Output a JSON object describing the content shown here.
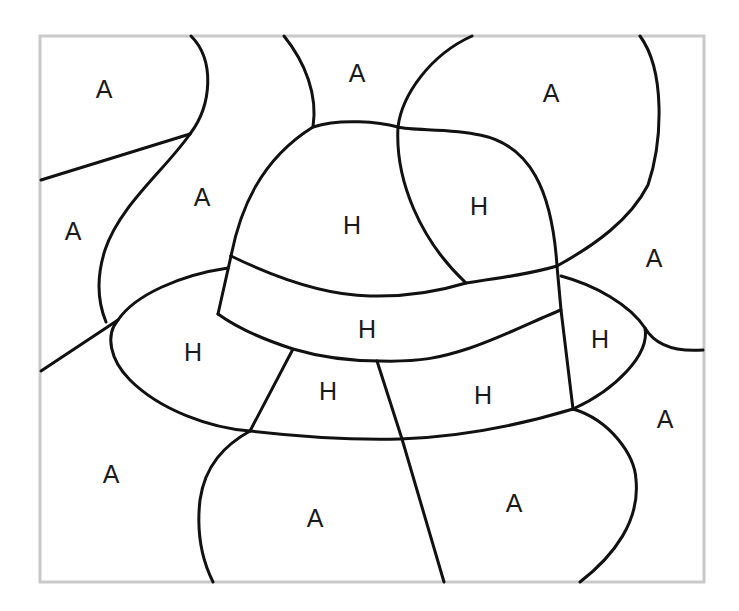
{
  "page": {
    "type": "color-by-letter worksheet"
  },
  "colors": {
    "ink": "#111111",
    "frame": "#c9c9c9",
    "background": "#ffffff"
  },
  "regions": {
    "hat": [
      {
        "label": "H",
        "x": 352,
        "y": 225
      },
      {
        "label": "H",
        "x": 479,
        "y": 206
      },
      {
        "label": "H",
        "x": 367,
        "y": 329
      },
      {
        "label": "H",
        "x": 193,
        "y": 352
      },
      {
        "label": "H",
        "x": 600,
        "y": 339
      },
      {
        "label": "H",
        "x": 328,
        "y": 391
      },
      {
        "label": "H",
        "x": 483,
        "y": 395
      }
    ],
    "background": [
      {
        "label": "A",
        "x": 104,
        "y": 89
      },
      {
        "label": "A",
        "x": 357,
        "y": 73
      },
      {
        "label": "A",
        "x": 551,
        "y": 93
      },
      {
        "label": "A",
        "x": 202,
        "y": 197
      },
      {
        "label": "A",
        "x": 73,
        "y": 231
      },
      {
        "label": "A",
        "x": 654,
        "y": 258
      },
      {
        "label": "A",
        "x": 665,
        "y": 419
      },
      {
        "label": "A",
        "x": 111,
        "y": 474
      },
      {
        "label": "A",
        "x": 315,
        "y": 518
      },
      {
        "label": "A",
        "x": 514,
        "y": 503
      }
    ]
  }
}
